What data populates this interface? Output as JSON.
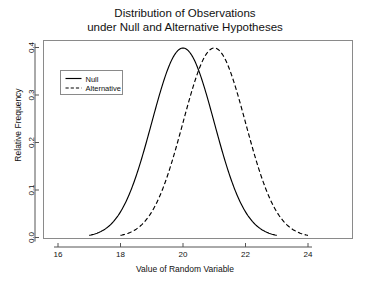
{
  "chart_data": {
    "type": "line",
    "title": "Distribution of Observations under Null and Alternative Hypotheses",
    "title_lines": [
      "Distribution of Observations",
      "under Null and Alternative Hypotheses"
    ],
    "xlabel": "Value of Random Variable",
    "ylabel": "Relative Frequency",
    "xlim": [
      15.5,
      25.5
    ],
    "ylim": [
      0.0,
      0.42
    ],
    "xticks": [
      16,
      18,
      20,
      22,
      24
    ],
    "xtick_labels": [
      "16",
      "18",
      "20",
      "22",
      "24"
    ],
    "yticks": [
      0.0,
      0.1,
      0.2,
      0.3,
      0.4
    ],
    "ytick_labels": [
      "0.0",
      "0.1",
      "0.2",
      "0.3",
      "0.4"
    ],
    "grid": false,
    "legend_position": "upper-left",
    "series": [
      {
        "name": "Null",
        "linestyle": "solid",
        "color": "#000000",
        "distribution": "normal",
        "mean": 20,
        "sd": 1.0,
        "peak": 0.399,
        "x_range": [
          17.0,
          23.0
        ],
        "x": [
          17.0,
          17.25,
          17.5,
          17.75,
          18.0,
          18.25,
          18.5,
          18.75,
          19.0,
          19.25,
          19.5,
          19.75,
          20.0,
          20.25,
          20.5,
          20.75,
          21.0,
          21.25,
          21.5,
          21.75,
          22.0,
          22.25,
          22.5,
          22.75,
          23.0
        ],
        "values": [
          0.0044,
          0.0079,
          0.0136,
          0.0228,
          0.054,
          0.079,
          0.1295,
          0.1942,
          0.242,
          0.3011,
          0.3521,
          0.3867,
          0.3989,
          0.3867,
          0.3521,
          0.3011,
          0.242,
          0.1942,
          0.1295,
          0.079,
          0.054,
          0.0228,
          0.0136,
          0.0079,
          0.0044
        ]
      },
      {
        "name": "Alternative",
        "linestyle": "dashed",
        "color": "#000000",
        "distribution": "normal",
        "mean": 21,
        "sd": 1.0,
        "peak": 0.399,
        "x_range": [
          18.0,
          24.0
        ],
        "x": [
          18.0,
          18.25,
          18.5,
          18.75,
          19.0,
          19.25,
          19.5,
          19.75,
          20.0,
          20.25,
          20.5,
          20.75,
          21.0,
          21.25,
          21.5,
          21.75,
          22.0,
          22.25,
          22.5,
          22.75,
          23.0,
          23.25,
          23.5,
          23.75,
          24.0
        ],
        "values": [
          0.0044,
          0.0079,
          0.0136,
          0.0228,
          0.054,
          0.079,
          0.1295,
          0.1942,
          0.242,
          0.3011,
          0.3521,
          0.3867,
          0.3989,
          0.3867,
          0.3521,
          0.3011,
          0.242,
          0.1942,
          0.1295,
          0.079,
          0.054,
          0.0228,
          0.0136,
          0.0079,
          0.0044
        ]
      }
    ],
    "legend": [
      {
        "label": "Null",
        "linestyle": "solid"
      },
      {
        "label": "Alternative",
        "linestyle": "dashed"
      }
    ]
  }
}
